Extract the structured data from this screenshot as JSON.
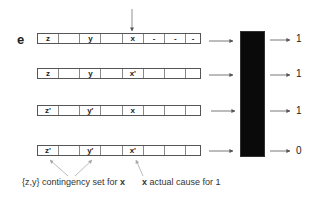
{
  "diagram": {
    "row_label": "e",
    "rows": [
      {
        "cells": [
          "z",
          "",
          "y",
          "",
          "x",
          "-",
          "-",
          "-"
        ],
        "output": "1"
      },
      {
        "cells": [
          "z",
          "",
          "y",
          "",
          "x'",
          "",
          "",
          ""
        ],
        "output": "1"
      },
      {
        "cells": [
          "z'",
          "",
          "y'",
          "",
          "x",
          "",
          "",
          ""
        ],
        "output": "1"
      },
      {
        "cells": [
          "z'",
          "",
          "y'",
          "",
          "x'",
          "",
          "",
          ""
        ],
        "output": "0"
      }
    ],
    "black_box": {
      "color": "#0a0a0a"
    },
    "captions": {
      "contingency": {
        "prefix": "{z,y} contingency set for ",
        "var": "x"
      },
      "cause": {
        "var": "x",
        "suffix": " actual cause for 1"
      }
    }
  }
}
